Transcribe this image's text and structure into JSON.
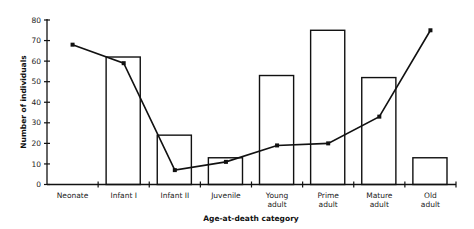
{
  "chart_data": {
    "type": "bar",
    "title": "",
    "xlabel": "Age-at-death category",
    "ylabel": "Number of individuals",
    "ylim": [
      0,
      80
    ],
    "yticks": [
      0,
      10,
      20,
      30,
      40,
      50,
      60,
      70,
      80
    ],
    "grid": false,
    "legend": null,
    "categories": [
      [
        "Neonate"
      ],
      [
        "Infant I"
      ],
      [
        "Infant II"
      ],
      [
        "Juvenile"
      ],
      [
        "Young",
        "adult"
      ],
      [
        "Prime",
        "adult"
      ],
      [
        "Mature",
        "adult"
      ],
      [
        "Old",
        "adult"
      ]
    ],
    "series": [
      {
        "name": "bars",
        "type": "bar",
        "values": [
          0,
          62,
          24,
          13,
          53,
          75,
          52,
          13
        ]
      },
      {
        "name": "line",
        "type": "line",
        "values": [
          68,
          59,
          7,
          11,
          19,
          20,
          33,
          75
        ]
      }
    ],
    "colors": {
      "bar_fill": "#ffffff",
      "bar_stroke": "#111111",
      "line": "#111111",
      "marker": "#111111",
      "axis": "#111111"
    }
  }
}
